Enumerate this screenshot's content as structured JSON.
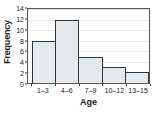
{
  "chart_data": {
    "type": "bar",
    "title": "",
    "subtitle": "",
    "xlabel": "Age",
    "ylabel": "Frequency",
    "categories": [
      "1–3",
      "4–6",
      "7–9",
      "10–12",
      "13–15"
    ],
    "values": [
      8,
      12,
      5,
      3,
      2
    ],
    "ylim": [
      0,
      14
    ],
    "yticks": [
      0,
      2,
      4,
      6,
      8,
      10,
      12,
      14
    ],
    "ytick_labels": [
      "0",
      "2",
      "4",
      "6",
      "8",
      "10",
      "12",
      "14"
    ],
    "grid": true,
    "grid_axis": "y",
    "legend": false,
    "legend_position": "none",
    "orientation": "vertical",
    "bar_style": "histogram-adjacent",
    "colors": {
      "bar_fill": "#e3e9ed",
      "bar_border": "#333333",
      "plot_background": "#ffffff",
      "frame": "#555555",
      "gridline": "#e8e8e8",
      "text": "#1a1a1a"
    }
  }
}
